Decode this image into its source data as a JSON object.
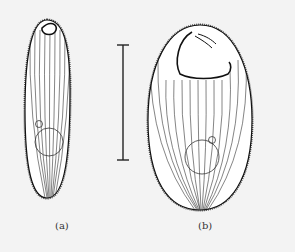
{
  "figure": {
    "panels": [
      {
        "id": "a",
        "label": "(a)",
        "description": "elongated ciliate cell with small oral apparatus at anterior end"
      },
      {
        "id": "b",
        "label": "(b)",
        "description": "broad oval ciliate cell with large oral apparatus at anterior end"
      }
    ],
    "scale_bar": {
      "orientation": "vertical",
      "label": ""
    },
    "colors": {
      "background": "#f3f3f3",
      "line": "#222222",
      "cell_fill": "#ffffff"
    }
  }
}
